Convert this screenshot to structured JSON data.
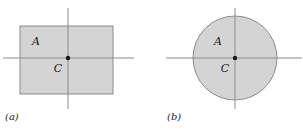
{
  "figure": {
    "width": 303,
    "height": 130,
    "background_color": "#ffffff",
    "panels": [
      {
        "id": "a",
        "caption": "(a)",
        "shape": "rectangle",
        "region_label": "A",
        "center_label": "C",
        "fill_color": "#d4d4d4",
        "stroke_color": "#8c8c8c",
        "axis_color": "#8c8c8c",
        "center_dot_color": "#1a1a1a",
        "geometry": {
          "rect_x": 20,
          "rect_y": 26,
          "rect_width": 93,
          "rect_height": 68,
          "center_x": 68,
          "center_y": 58,
          "h_axis_x1": 3,
          "h_axis_x2": 134,
          "v_axis_y1": 8,
          "v_axis_y2": 109,
          "label_a_x": 36,
          "label_a_y": 45,
          "label_c_x": 58,
          "label_c_y": 72,
          "caption_x": 5,
          "caption_y": 120
        }
      },
      {
        "id": "b",
        "caption": "(b)",
        "shape": "circle",
        "region_label": "A",
        "center_label": "C",
        "fill_color": "#d4d4d4",
        "stroke_color": "#8c8c8c",
        "axis_color": "#8c8c8c",
        "center_dot_color": "#1a1a1a",
        "geometry": {
          "circle_cx": 84,
          "circle_cy": 58,
          "circle_r": 42,
          "h_axis_x1": 15,
          "h_axis_x2": 151,
          "v_axis_y1": 8,
          "v_axis_y2": 109,
          "label_a_x": 67,
          "label_a_y": 45,
          "label_c_x": 74,
          "label_c_y": 72,
          "caption_x": 16,
          "caption_y": 120
        }
      }
    ]
  }
}
